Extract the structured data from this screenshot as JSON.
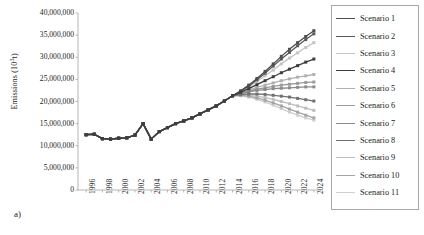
{
  "panel": {
    "label": "a)"
  },
  "axes": {
    "y_title_text": "Emissions (10",
    "y_title_sup": "3",
    "y_title_tail": "t)",
    "y_title_full": "Emissions (10³t)"
  },
  "chart_data": {
    "type": "line",
    "title": "",
    "xlabel": "",
    "ylabel": "Emissions (10³t)",
    "ylim": [
      0,
      40000000
    ],
    "ytick_values": [
      0,
      5000000,
      10000000,
      15000000,
      20000000,
      25000000,
      30000000,
      35000000,
      40000000
    ],
    "ytick_labels": [
      "0",
      "5,000,000",
      "10,000,000",
      "15,000,000",
      "20,000,000",
      "25,000,000",
      "30,000,000",
      "35,000,000",
      "40,000,000"
    ],
    "xlim": [
      1995,
      2025
    ],
    "xtick_labels": [
      "1996",
      "1998",
      "2000",
      "2002",
      "2004",
      "2006",
      "2008",
      "2010",
      "2012",
      "2014",
      "2016",
      "2018",
      "2020",
      "2022",
      "2024"
    ],
    "x": [
      1996,
      1997,
      1998,
      1999,
      2000,
      2001,
      2002,
      2003,
      2004,
      2005,
      2006,
      2007,
      2008,
      2009,
      2010,
      2011,
      2012,
      2013,
      2014,
      2015,
      2016,
      2017,
      2018,
      2019,
      2020,
      2021,
      2022,
      2023,
      2024
    ],
    "grid": false,
    "legend_position": "right",
    "marker": "square",
    "series": [
      {
        "name": "Scenario 1",
        "color": "#4d4d4d",
        "values": [
          12500000,
          12600000,
          11600000,
          11500000,
          11700000,
          11800000,
          12400000,
          15000000,
          11500000,
          13200000,
          14100000,
          15000000,
          15600000,
          16300000,
          17200000,
          18100000,
          19000000,
          20100000,
          21300000,
          22400000,
          23700000,
          25200000,
          26800000,
          28500000,
          30200000,
          31800000,
          33300000,
          34700000,
          36000000
        ]
      },
      {
        "name": "Scenario 2",
        "color": "#595959",
        "values": [
          12500000,
          12600000,
          11600000,
          11500000,
          11700000,
          11800000,
          12400000,
          15000000,
          11500000,
          13200000,
          14100000,
          15000000,
          15600000,
          16300000,
          17200000,
          18100000,
          19000000,
          20100000,
          21300000,
          22300000,
          23500000,
          24900000,
          26400000,
          28000000,
          29600000,
          31100000,
          32600000,
          34000000,
          35300000
        ]
      },
      {
        "name": "Scenario 3",
        "color": "#c4c4c4",
        "values": [
          12500000,
          12600000,
          11600000,
          11500000,
          11700000,
          11800000,
          12400000,
          15000000,
          11500000,
          13200000,
          14100000,
          15000000,
          15600000,
          16300000,
          17200000,
          18100000,
          19000000,
          20100000,
          21300000,
          22200000,
          23300000,
          24500000,
          25800000,
          27100000,
          28500000,
          29800000,
          31000000,
          32200000,
          33300000
        ]
      },
      {
        "name": "Scenario 4",
        "color": "#3d3d3d",
        "values": [
          12500000,
          12600000,
          11600000,
          11500000,
          11700000,
          11800000,
          12400000,
          15000000,
          11500000,
          13200000,
          14100000,
          15000000,
          15600000,
          16300000,
          17200000,
          18100000,
          19000000,
          20100000,
          21300000,
          22100000,
          22900000,
          23800000,
          24700000,
          25600000,
          26500000,
          27300000,
          28100000,
          28900000,
          29600000
        ]
      },
      {
        "name": "Scenario 5",
        "color": "#b0b0b0",
        "values": [
          12500000,
          12600000,
          11600000,
          11500000,
          11700000,
          11800000,
          12400000,
          15000000,
          11500000,
          13200000,
          14100000,
          15000000,
          15600000,
          16300000,
          17200000,
          18100000,
          19000000,
          20100000,
          21300000,
          22000000,
          22600000,
          23200000,
          23700000,
          24200000,
          24700000,
          25100000,
          25500000,
          25800000,
          26100000
        ]
      },
      {
        "name": "Scenario 6",
        "color": "#9a9a9a",
        "values": [
          12500000,
          12600000,
          11600000,
          11500000,
          11700000,
          11800000,
          12400000,
          15000000,
          11500000,
          13200000,
          14100000,
          15000000,
          15600000,
          16300000,
          17200000,
          18100000,
          19000000,
          20100000,
          21300000,
          21900000,
          22400000,
          22800000,
          23100000,
          23400000,
          23700000,
          23900000,
          24100000,
          24300000,
          24400000
        ]
      },
      {
        "name": "Scenario 7",
        "color": "#8a8a8a",
        "values": [
          12500000,
          12600000,
          11600000,
          11500000,
          11700000,
          11800000,
          12400000,
          15000000,
          11500000,
          13200000,
          14100000,
          15000000,
          15600000,
          16300000,
          17200000,
          18100000,
          19000000,
          20100000,
          21300000,
          21800000,
          22200000,
          22500000,
          22700000,
          22900000,
          23000000,
          23100000,
          23200000,
          23300000,
          23300000
        ]
      },
      {
        "name": "Scenario 8",
        "color": "#707070",
        "values": [
          12500000,
          12600000,
          11600000,
          11500000,
          11700000,
          11800000,
          12400000,
          15000000,
          11500000,
          13200000,
          14100000,
          15000000,
          15600000,
          16300000,
          17200000,
          18100000,
          19000000,
          20100000,
          21300000,
          21600000,
          21700000,
          21700000,
          21600000,
          21400000,
          21200000,
          21000000,
          20700000,
          20400000,
          20100000
        ]
      },
      {
        "name": "Scenario 9",
        "color": "#bdbdbd",
        "values": [
          12500000,
          12600000,
          11600000,
          11500000,
          11700000,
          11800000,
          12400000,
          15000000,
          11500000,
          13200000,
          14100000,
          15000000,
          15600000,
          16300000,
          17200000,
          18100000,
          19000000,
          20100000,
          21300000,
          21500000,
          21400000,
          21200000,
          20900000,
          20500000,
          20000000,
          19500000,
          19000000,
          18500000,
          18000000
        ]
      },
      {
        "name": "Scenario 10",
        "color": "#a5a5a5",
        "values": [
          12500000,
          12600000,
          11600000,
          11500000,
          11700000,
          11800000,
          12400000,
          15000000,
          11500000,
          13200000,
          14100000,
          15000000,
          15600000,
          16300000,
          17200000,
          18100000,
          19000000,
          20100000,
          21300000,
          21400000,
          21200000,
          20800000,
          20300000,
          19700000,
          19000000,
          18300000,
          17600000,
          16900000,
          16300000
        ]
      },
      {
        "name": "Scenario 11",
        "color": "#cfcfcf",
        "values": [
          12500000,
          12600000,
          11600000,
          11500000,
          11700000,
          11800000,
          12400000,
          15000000,
          11500000,
          13200000,
          14100000,
          15000000,
          15600000,
          16300000,
          17200000,
          18100000,
          19000000,
          20100000,
          21300000,
          21300000,
          21000000,
          20500000,
          19900000,
          19200000,
          18400000,
          17600000,
          16900000,
          16300000,
          15800000
        ]
      }
    ]
  }
}
